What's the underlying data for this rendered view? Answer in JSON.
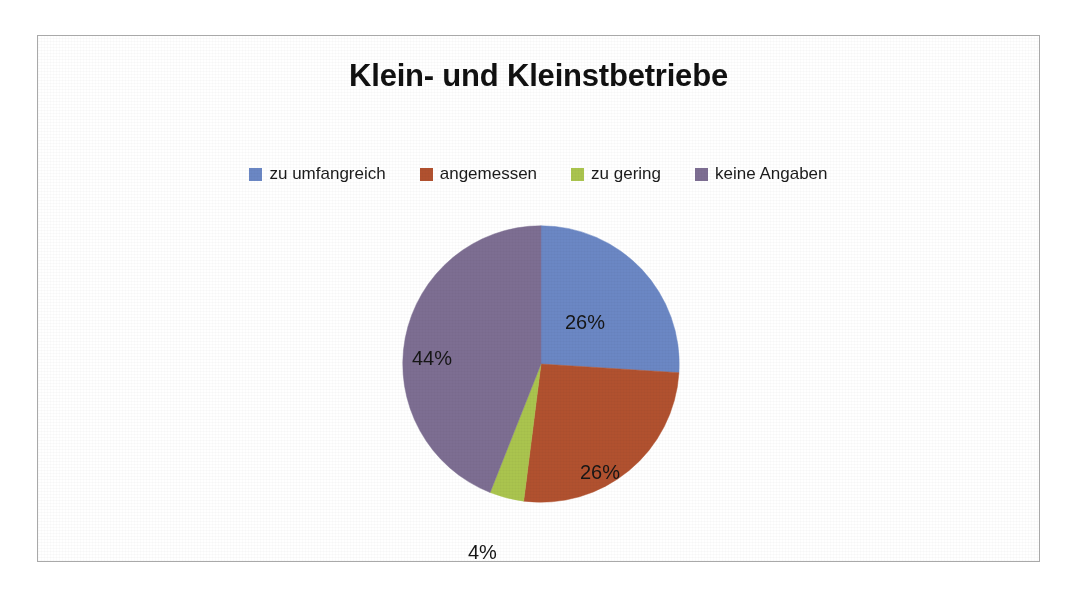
{
  "chart_data": {
    "type": "pie",
    "title": "Klein- und Kleinstbetriebe",
    "categories": [
      "zu umfangreich",
      "angemessen",
      "zu gering",
      "keine Angaben"
    ],
    "values": [
      26,
      26,
      4,
      44
    ],
    "value_labels": [
      "26%",
      "26%",
      "4%",
      "44%"
    ],
    "unit": "%",
    "colors": [
      "#6b87c4",
      "#b1512f",
      "#aac44e",
      "#7d6e92"
    ],
    "legend_position": "top",
    "start_angle_deg": 0,
    "direction": "clockwise",
    "grid": false,
    "xlabel": "",
    "ylabel": ""
  },
  "title": {
    "text": "Klein- und Kleinstbetriebe"
  },
  "legend": {
    "items": [
      {
        "label": "zu umfangreich",
        "color": "#6b87c4"
      },
      {
        "label": "angemessen",
        "color": "#b1512f"
      },
      {
        "label": "zu gering",
        "color": "#aac44e"
      },
      {
        "label": "keine Angaben",
        "color": "#7d6e92"
      }
    ]
  },
  "pie": {
    "slices": [
      {
        "name": "zu umfangreich",
        "label": "26%",
        "value": 26,
        "color": "#6b87c4"
      },
      {
        "name": "angemessen",
        "label": "26%",
        "value": 26,
        "color": "#b1512f"
      },
      {
        "name": "zu gering",
        "label": "4%",
        "value": 4,
        "color": "#aac44e"
      },
      {
        "name": "keine Angaben",
        "label": "44%",
        "value": 44,
        "color": "#7d6e92"
      }
    ]
  }
}
